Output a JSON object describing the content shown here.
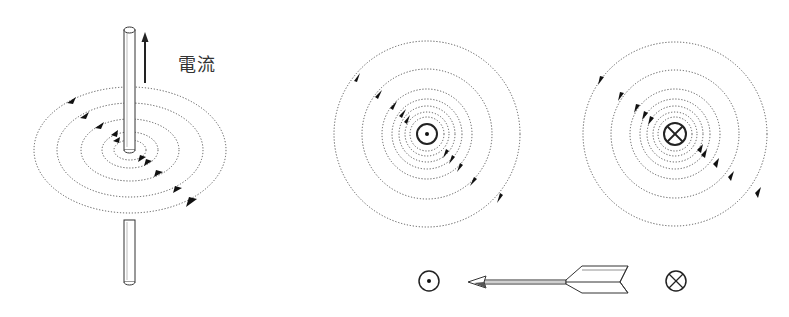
{
  "figure": {
    "current_label": "電流",
    "panels": [
      {
        "name": "wire-perspective",
        "description": "straight wire with current flowing upward, concentric dotted magnetic field lines"
      },
      {
        "name": "field-out-of-page",
        "symbol": "dot-in-circle",
        "field_direction": "counterclockwise"
      },
      {
        "name": "field-into-page",
        "symbol": "cross-in-circle",
        "field_direction": "clockwise"
      }
    ],
    "legend": {
      "out_symbol": "⊙",
      "into_symbol": "⊗",
      "analogy": "arrow"
    },
    "colors": {
      "line": "#555555",
      "ink": "#111111",
      "background": "#ffffff"
    }
  }
}
